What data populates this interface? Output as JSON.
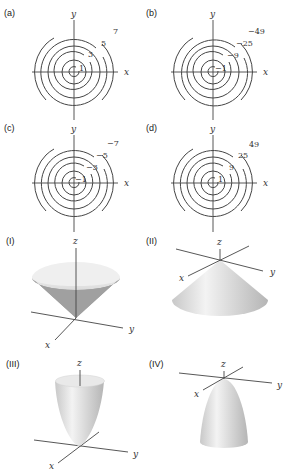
{
  "contour_plots": [
    {
      "id": "a",
      "label": "(a)",
      "x_label": "x",
      "y_label": "y",
      "levels": [
        "1",
        "3",
        "5",
        "7"
      ]
    },
    {
      "id": "b",
      "label": "(b)",
      "x_label": "x",
      "y_label": "y",
      "levels": [
        "−1",
        "−9",
        "−25",
        "−49"
      ]
    },
    {
      "id": "c",
      "label": "(c)",
      "x_label": "x",
      "y_label": "y",
      "levels": [
        "−1",
        "−3",
        "−5",
        "−7"
      ]
    },
    {
      "id": "d",
      "label": "(d)",
      "x_label": "x",
      "y_label": "y",
      "levels": [
        "1",
        "9",
        "25",
        "49"
      ]
    }
  ],
  "surface_plots": [
    {
      "id": "I",
      "label": "(I)",
      "shape": "cone opening upward",
      "x_label": "x",
      "y_label": "y",
      "z_label": "z"
    },
    {
      "id": "II",
      "label": "(II)",
      "shape": "cone opening downward",
      "x_label": "x",
      "y_label": "y",
      "z_label": "z"
    },
    {
      "id": "III",
      "label": "(III)",
      "shape": "paraboloid opening upward",
      "x_label": "x",
      "y_label": "y",
      "z_label": "z"
    },
    {
      "id": "IV",
      "label": "(IV)",
      "shape": "paraboloid opening downward",
      "x_label": "x",
      "y_label": "y",
      "z_label": "z"
    }
  ],
  "colors": {
    "line": "#444444",
    "surface_light": "#f2f2f2",
    "surface_dark": "#9a9a9a"
  }
}
